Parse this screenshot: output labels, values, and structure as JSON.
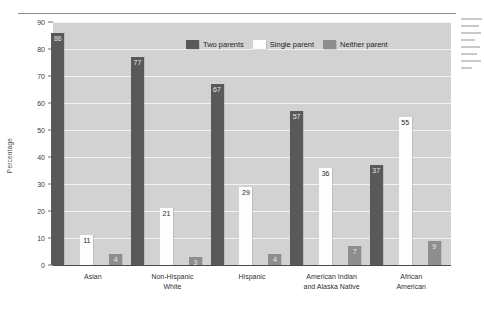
{
  "chart_data": {
    "type": "bar",
    "title": "",
    "xlabel": "",
    "ylabel": "Percentage",
    "ylim": [
      0,
      90
    ],
    "yticks": [
      0,
      10,
      20,
      30,
      40,
      50,
      60,
      70,
      80,
      90
    ],
    "grid": true,
    "legend_position": "top-center",
    "categories": [
      "Asian",
      "Non-Hispanic White",
      "Hispanic",
      "American Indian and Alaska Native",
      "African American"
    ],
    "category_lines": [
      [
        "Asian",
        ""
      ],
      [
        "Non-Hispanic",
        "White"
      ],
      [
        "Hispanic",
        ""
      ],
      [
        "American Indian",
        "and Alaska Native"
      ],
      [
        "African",
        "American"
      ]
    ],
    "series": [
      {
        "name": "Two parents",
        "color": "#59595b",
        "values": [
          86,
          77,
          67,
          57,
          37
        ]
      },
      {
        "name": "Single parent",
        "color": "#fdfdfd",
        "values": [
          11,
          21,
          29,
          36,
          55
        ]
      },
      {
        "name": "Neither parent",
        "color": "#8e8e90",
        "values": [
          4,
          3,
          4,
          7,
          9
        ]
      }
    ]
  },
  "legend": {
    "items": [
      {
        "label": "Two parents",
        "swatch": "two"
      },
      {
        "label": "Single parent",
        "swatch": "single"
      },
      {
        "label": "Neither parent",
        "swatch": "neither"
      }
    ]
  },
  "axis": {
    "y_title": "Percentage"
  }
}
